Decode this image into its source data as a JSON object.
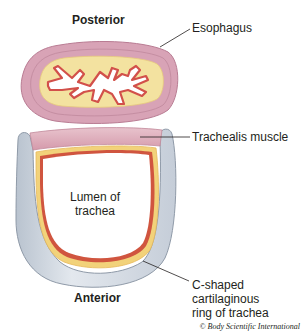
{
  "diagram": {
    "orientation": {
      "top": "Posterior",
      "bottom": "Anterior"
    },
    "labels": {
      "esophagus": "Esophagus",
      "trachealis": "Trachealis muscle",
      "lumen_line1": "Lumen of",
      "lumen_line2": "trachea",
      "cartilage_line1": "C-shaped",
      "cartilage_line2": "cartilaginous",
      "cartilage_line3": "ring of trachea"
    },
    "credit": "© Body Scientific International",
    "colors": {
      "esophagus_wall": "#d8a3b6",
      "esophagus_wall_stroke": "#b97c93",
      "submucosa": "#f3e2a0",
      "mucosa_outline": "#d2504a",
      "trachealis": "#dcaab8",
      "cartilage": "#d5dde6",
      "cartilage_stroke": "#8f9aa8",
      "mucosa_yellow": "#f2d27a",
      "mucosa_red": "#d0553f",
      "leader_line": "#231f20"
    }
  }
}
